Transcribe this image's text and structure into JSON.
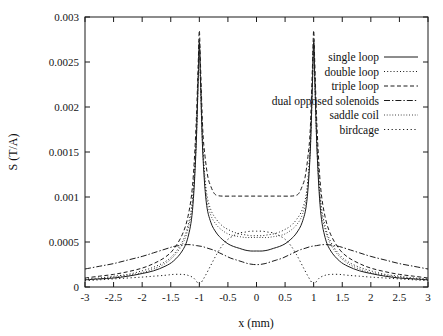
{
  "figure": {
    "width": 443,
    "height": 336,
    "background": "#ffffff",
    "ink_color": "#1b1b1b"
  },
  "plot_box": {
    "left": 85,
    "right": 428,
    "top": 17,
    "bottom": 287
  },
  "chart_data": {
    "type": "line",
    "title": "",
    "xlabel": "x (mm)",
    "ylabel": "S (T/A)",
    "xlim": [
      -3,
      3
    ],
    "ylim": [
      0,
      0.003
    ],
    "xticks": [
      -3,
      -2.5,
      -2,
      -1.5,
      -1,
      -0.5,
      0,
      0.5,
      1,
      1.5,
      2,
      2.5,
      3
    ],
    "xticklabels": [
      "-3",
      "-2.5",
      "-2",
      "-1.5",
      "-1",
      "-0.5",
      "0",
      "0.5",
      "1",
      "1.5",
      "2",
      "2.5",
      "3"
    ],
    "yticks": [
      0,
      0.0005,
      0.001,
      0.0015,
      0.002,
      0.0025,
      0.003
    ],
    "yticklabels": [
      "0",
      "0.0005",
      "0.001",
      "0.0015",
      "0.002",
      "0.0025",
      "0.003"
    ],
    "grid": false,
    "legend_position": "upper right inside",
    "tick_direction": "in",
    "series": [
      {
        "name": "single loop",
        "linestyle": "solid",
        "dasharray": "",
        "x": [
          -3,
          -2.75,
          -2.5,
          -2.25,
          -2,
          -1.8,
          -1.6,
          -1.45,
          -1.3,
          -1.2,
          -1.12,
          -1.06,
          -1.02,
          -1.0,
          -0.98,
          -0.94,
          -0.88,
          -0.8,
          -0.7,
          -0.6,
          -0.5,
          -0.4,
          -0.3,
          -0.2,
          -0.1,
          0,
          0.1,
          0.2,
          0.3,
          0.4,
          0.5,
          0.6,
          0.7,
          0.8,
          0.88,
          0.94,
          0.98,
          1.0,
          1.02,
          1.06,
          1.12,
          1.2,
          1.3,
          1.45,
          1.6,
          1.8,
          2,
          2.25,
          2.5,
          2.75,
          3
        ],
        "y": [
          8e-05,
          9e-05,
          0.0001,
          0.00012,
          0.00015,
          0.00018,
          0.00023,
          0.00029,
          0.0004,
          0.00055,
          0.00085,
          0.0015,
          0.0023,
          0.00272,
          0.0023,
          0.0015,
          0.00095,
          0.00072,
          0.0006,
          0.00053,
          0.00048,
          0.00045,
          0.00043,
          0.00041,
          0.0004,
          0.0004,
          0.0004,
          0.00041,
          0.00043,
          0.00045,
          0.00048,
          0.00053,
          0.0006,
          0.00072,
          0.00095,
          0.0015,
          0.0023,
          0.00272,
          0.0023,
          0.0015,
          0.00085,
          0.00055,
          0.0004,
          0.00029,
          0.00023,
          0.00018,
          0.00015,
          0.00012,
          0.0001,
          9e-05,
          8e-05
        ]
      },
      {
        "name": "double loop",
        "linestyle": "dotted",
        "dasharray": "1,2.2",
        "x": [
          -3,
          -2.75,
          -2.5,
          -2.25,
          -2,
          -1.8,
          -1.6,
          -1.45,
          -1.3,
          -1.2,
          -1.12,
          -1.06,
          -1.02,
          -1.0,
          -0.98,
          -0.94,
          -0.88,
          -0.8,
          -0.7,
          -0.6,
          -0.5,
          -0.4,
          -0.3,
          -0.2,
          -0.1,
          0,
          0.1,
          0.2,
          0.3,
          0.4,
          0.5,
          0.6,
          0.7,
          0.8,
          0.88,
          0.94,
          0.98,
          1.0,
          1.02,
          1.06,
          1.12,
          1.2,
          1.3,
          1.45,
          1.6,
          1.8,
          2,
          2.25,
          2.5,
          2.75,
          3
        ],
        "y": [
          9e-05,
          0.0001,
          0.00012,
          0.00014,
          0.00018,
          0.00022,
          0.00028,
          0.00036,
          0.0005,
          0.00068,
          0.00098,
          0.0016,
          0.00235,
          0.00275,
          0.00235,
          0.0016,
          0.00108,
          0.00086,
          0.00075,
          0.00068,
          0.00064,
          0.00061,
          0.00059,
          0.00058,
          0.00057,
          0.00057,
          0.00057,
          0.00058,
          0.00059,
          0.00061,
          0.00064,
          0.00068,
          0.00075,
          0.00086,
          0.00108,
          0.0016,
          0.00235,
          0.00275,
          0.00235,
          0.0016,
          0.00098,
          0.00068,
          0.0005,
          0.00036,
          0.00028,
          0.00022,
          0.00018,
          0.00014,
          0.00012,
          0.0001,
          9e-05
        ]
      },
      {
        "name": "triple loop",
        "linestyle": "dashed",
        "dasharray": "4,2.5",
        "x": [
          -3,
          -2.75,
          -2.5,
          -2.25,
          -2,
          -1.8,
          -1.6,
          -1.45,
          -1.3,
          -1.2,
          -1.12,
          -1.06,
          -1.02,
          -1.0,
          -0.98,
          -0.94,
          -0.9,
          -0.85,
          -0.8,
          -0.75,
          -0.7,
          -0.6,
          -0.4,
          -0.2,
          0,
          0.2,
          0.4,
          0.6,
          0.7,
          0.75,
          0.8,
          0.85,
          0.9,
          0.94,
          0.98,
          1.0,
          1.02,
          1.06,
          1.12,
          1.2,
          1.3,
          1.45,
          1.6,
          1.8,
          2,
          2.25,
          2.5,
          2.75,
          3
        ],
        "y": [
          0.0001,
          0.00012,
          0.00014,
          0.00017,
          0.00021,
          0.00026,
          0.00033,
          0.00042,
          0.00058,
          0.00078,
          0.00112,
          0.00175,
          0.00248,
          0.00285,
          0.00248,
          0.00175,
          0.00145,
          0.00122,
          0.00112,
          0.00105,
          0.00102,
          0.00101,
          0.00101,
          0.00101,
          0.00101,
          0.00101,
          0.00101,
          0.00101,
          0.00102,
          0.00105,
          0.00112,
          0.00122,
          0.00145,
          0.00175,
          0.00248,
          0.00285,
          0.00248,
          0.00175,
          0.00112,
          0.00078,
          0.00058,
          0.00042,
          0.00033,
          0.00026,
          0.00021,
          0.00017,
          0.00014,
          0.00012,
          0.0001
        ]
      },
      {
        "name": "dual opposed solenoids",
        "linestyle": "dash-dot",
        "dasharray": "6,2,1.4,2",
        "x": [
          -3,
          -2.75,
          -2.5,
          -2.25,
          -2,
          -1.8,
          -1.6,
          -1.45,
          -1.35,
          -1.25,
          -1.15,
          -1.05,
          -0.95,
          -0.85,
          -0.75,
          -0.65,
          -0.55,
          -0.45,
          -0.35,
          -0.25,
          -0.15,
          -0.05,
          0.05,
          0.15,
          0.25,
          0.35,
          0.45,
          0.55,
          0.65,
          0.75,
          0.85,
          0.95,
          1.05,
          1.15,
          1.25,
          1.35,
          1.45,
          1.6,
          1.8,
          2,
          2.25,
          2.5,
          2.75,
          3
        ],
        "y": [
          0.0002,
          0.00023,
          0.00026,
          0.0003,
          0.00034,
          0.00038,
          0.00042,
          0.00045,
          0.00046,
          0.00047,
          0.00047,
          0.00046,
          0.00045,
          0.00043,
          0.00041,
          0.00038,
          0.00035,
          0.00032,
          0.0003,
          0.00028,
          0.00026,
          0.00025,
          0.00025,
          0.00026,
          0.00028,
          0.0003,
          0.00032,
          0.00035,
          0.00038,
          0.00041,
          0.00043,
          0.00045,
          0.00046,
          0.00047,
          0.00047,
          0.00046,
          0.00045,
          0.00042,
          0.00038,
          0.00034,
          0.0003,
          0.00026,
          0.00023,
          0.0002
        ]
      },
      {
        "name": "saddle coil",
        "linestyle": "fine-dotted",
        "dasharray": "0.8,2",
        "x": [
          -3,
          -2.75,
          -2.5,
          -2.25,
          -2,
          -1.8,
          -1.6,
          -1.45,
          -1.3,
          -1.2,
          -1.12,
          -1.06,
          -1.02,
          -1.0,
          -0.98,
          -0.94,
          -0.88,
          -0.8,
          -0.7,
          -0.6,
          -0.5,
          -0.4,
          -0.3,
          -0.2,
          -0.1,
          0,
          0.1,
          0.2,
          0.3,
          0.4,
          0.5,
          0.6,
          0.7,
          0.8,
          0.88,
          0.94,
          0.98,
          1.0,
          1.02,
          1.06,
          1.12,
          1.2,
          1.3,
          1.45,
          1.6,
          1.8,
          2,
          2.25,
          2.5,
          2.75,
          3
        ],
        "y": [
          8e-05,
          9e-05,
          0.00011,
          0.00013,
          0.00016,
          0.0002,
          0.00026,
          0.00034,
          0.00047,
          0.00064,
          0.00092,
          0.00152,
          0.00228,
          0.0027,
          0.00228,
          0.00152,
          0.00102,
          0.0008,
          0.00069,
          0.00063,
          0.00059,
          0.00057,
          0.00056,
          0.00055,
          0.00055,
          0.00055,
          0.00055,
          0.00055,
          0.00056,
          0.00057,
          0.00059,
          0.00063,
          0.00069,
          0.0008,
          0.00102,
          0.00152,
          0.00228,
          0.0027,
          0.00228,
          0.00152,
          0.00092,
          0.00064,
          0.00047,
          0.00034,
          0.00026,
          0.0002,
          0.00016,
          0.00013,
          0.00011,
          9e-05,
          8e-05
        ]
      },
      {
        "name": "birdcage",
        "linestyle": "sparse-dotted",
        "dasharray": "1.2,2.6",
        "x": [
          -3,
          -2.75,
          -2.5,
          -2.25,
          -2,
          -1.8,
          -1.6,
          -1.45,
          -1.3,
          -1.2,
          -1.1,
          -1.02,
          -0.98,
          -0.9,
          -0.8,
          -0.7,
          -0.6,
          -0.5,
          -0.4,
          -0.3,
          -0.2,
          -0.1,
          0,
          0.1,
          0.2,
          0.3,
          0.4,
          0.5,
          0.6,
          0.7,
          0.8,
          0.9,
          0.98,
          1.02,
          1.1,
          1.2,
          1.3,
          1.45,
          1.6,
          1.8,
          2,
          2.25,
          2.5,
          2.75,
          3
        ],
        "y": [
          7e-05,
          8e-05,
          9e-05,
          0.0001,
          0.00011,
          0.00012,
          0.00013,
          0.00014,
          0.00014,
          0.00013,
          0.0001,
          4e-05,
          4e-05,
          0.00012,
          0.00024,
          0.00036,
          0.00046,
          0.00053,
          0.00057,
          0.0006,
          0.00061,
          0.00062,
          0.00062,
          0.00062,
          0.00061,
          0.0006,
          0.00057,
          0.00053,
          0.00046,
          0.00036,
          0.00024,
          0.00012,
          4e-05,
          4e-05,
          0.0001,
          0.00013,
          0.00014,
          0.00014,
          0.00013,
          0.00012,
          0.00011,
          0.0001,
          9e-05,
          8e-05,
          7e-05
        ]
      }
    ]
  },
  "legend": {
    "entries": [
      {
        "label": "single loop"
      },
      {
        "label": "double loop"
      },
      {
        "label": "triple loop"
      },
      {
        "label": "dual opposed solenoids"
      },
      {
        "label": "saddle coil"
      },
      {
        "label": "birdcage"
      }
    ]
  }
}
